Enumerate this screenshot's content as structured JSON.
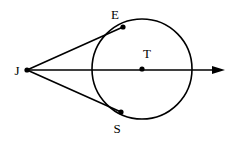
{
  "figure": {
    "kind": "geometry-diagram",
    "canvas": {
      "width": 235,
      "height": 141,
      "background": "#ffffff"
    },
    "stroke_color": "#000000",
    "label_color": "#000000",
    "line_width": 1.6
  },
  "circle": {
    "name": "circle-T",
    "center_x": 142,
    "center_y": 69,
    "radius": 50
  },
  "points": [
    {
      "id": "J",
      "label": "J",
      "x": 27,
      "y": 70,
      "label_x": 17,
      "label_y": 75,
      "has_dot": true,
      "role": "external-point"
    },
    {
      "id": "E",
      "label": "E",
      "x": 123,
      "y": 27,
      "label_x": 115,
      "label_y": 19,
      "has_dot": true,
      "role": "tangent-point-upper"
    },
    {
      "id": "T",
      "label": "T",
      "x": 142,
      "y": 69,
      "label_x": 147,
      "label_y": 58,
      "has_dot": true,
      "role": "circle-center"
    },
    {
      "id": "S",
      "label": "S",
      "x": 121,
      "y": 112,
      "label_x": 117,
      "label_y": 133,
      "has_dot": true,
      "role": "tangent-point-lower"
    }
  ],
  "segments": [
    {
      "id": "JE",
      "name": "tangent-segment-je",
      "from": "J",
      "to": "E",
      "x1": 27,
      "y1": 70,
      "x2": 123,
      "y2": 27
    },
    {
      "id": "JS",
      "name": "tangent-segment-js",
      "from": "J",
      "to": "S",
      "x1": 27,
      "y1": 70,
      "x2": 121,
      "y2": 112
    }
  ],
  "ray": {
    "id": "JT-ray",
    "name": "ray-j-through-t",
    "from": "J",
    "through": "T",
    "x1": 27,
    "y1": 70,
    "x2": 225,
    "y2": 70,
    "arrow_tip_x": 225,
    "arrow_tip_y": 70,
    "arrow_base_x": 212,
    "arrow_half_height": 4
  }
}
